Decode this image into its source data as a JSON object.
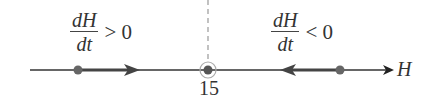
{
  "diagram": {
    "type": "phase-line",
    "axis_label": "H",
    "equilibrium": {
      "value": "15",
      "x": 208
    },
    "left_region": {
      "numerator": "dH",
      "denominator": "dt",
      "relation": "> 0",
      "direction": "right"
    },
    "right_region": {
      "numerator": "dH",
      "denominator": "dt",
      "relation": "< 0",
      "direction": "left"
    },
    "colors": {
      "line": "#333333",
      "arrow": "#444444",
      "dot": "#666666",
      "dashed": "#999999"
    }
  }
}
